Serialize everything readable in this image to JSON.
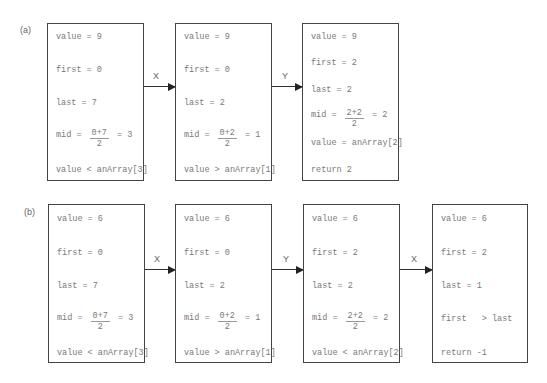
{
  "panels": [
    {
      "label": "(a)",
      "boxes": [
        {
          "lines": [
            {
              "text": "value = 9"
            },
            {
              "text": "first = 0"
            },
            {
              "text": "last = 7"
            },
            {
              "prefix": "mid = ",
              "num": "0+7",
              "den": "2",
              "suffix": " = 3"
            },
            {
              "text": "value < anArray[3]"
            }
          ]
        },
        {
          "lines": [
            {
              "text": "value = 9"
            },
            {
              "text": "first = 0"
            },
            {
              "text": "last = 2"
            },
            {
              "prefix": "mid = ",
              "num": "0+2",
              "den": "2",
              "suffix": " = 1"
            },
            {
              "text": "value > anArray[1]"
            }
          ]
        },
        {
          "lines": [
            {
              "text": "value = 9"
            },
            {
              "text": "first = 2"
            },
            {
              "text": "last = 2"
            },
            {
              "prefix": "mid = ",
              "num": "2+2",
              "den": "2",
              "suffix": " = 2"
            },
            {
              "text": "value = anArray[2]"
            },
            {
              "text": "return 2"
            }
          ]
        }
      ],
      "arrows": [
        "X",
        "Y"
      ]
    },
    {
      "label": "(b)",
      "boxes": [
        {
          "lines": [
            {
              "text": "value = 6"
            },
            {
              "text": "first = 0"
            },
            {
              "text": "last = 7"
            },
            {
              "prefix": "mid = ",
              "num": "0+7",
              "den": "2",
              "suffix": " = 3"
            },
            {
              "text": "value < anArray[3]"
            }
          ]
        },
        {
          "lines": [
            {
              "text": "value = 6"
            },
            {
              "text": "first = 0"
            },
            {
              "text": "last = 2"
            },
            {
              "prefix": "mid = ",
              "num": "0+2",
              "den": "2",
              "suffix": " = 1"
            },
            {
              "text": "value > anArray[1]"
            }
          ]
        },
        {
          "lines": [
            {
              "text": "value = 6"
            },
            {
              "text": "first = 2"
            },
            {
              "text": "last = 2"
            },
            {
              "prefix": "mid = ",
              "num": "2+2",
              "den": "2",
              "suffix": " = 2"
            },
            {
              "text": "value < anArray[2]"
            }
          ]
        },
        {
          "lines": [
            {
              "text": "value = 6"
            },
            {
              "text": "first = 2"
            },
            {
              "text": "last = 1"
            },
            {
              "text": "first   > last"
            },
            {
              "text": "return -1"
            }
          ]
        }
      ],
      "arrows": [
        "X",
        "Y",
        "X"
      ]
    }
  ]
}
